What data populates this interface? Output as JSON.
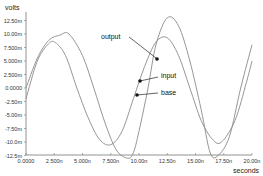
{
  "chart_data": {
    "type": "line",
    "title": "",
    "xlabel": "seconds",
    "ylabel": "volts",
    "xlim": [
      0,
      2e-08
    ],
    "ylim": [
      -0.0135,
      0.014
    ],
    "grid": false,
    "x_ticks": [
      "0.0000",
      "2.500n",
      "5.000n",
      "7.500n",
      "10.00n",
      "12.50n",
      "15.00n",
      "17.50n",
      "20.00n"
    ],
    "y_ticks": [
      "12.50m",
      "10.00m",
      "7.500m",
      "5.000m",
      "2.500m",
      "0.0000",
      "-2.50m",
      "-5.00m",
      "-7.50m",
      "-10.0m",
      "-12.5m"
    ],
    "annotations": [
      "output",
      "input",
      "base"
    ],
    "series": [
      {
        "name": "output",
        "x_ns": [
          0,
          1,
          2,
          3,
          3.8,
          5,
          6,
          7,
          8,
          9,
          9.5,
          10,
          10.8,
          11.5,
          12.5,
          13.5,
          14.5,
          15.5,
          16.3,
          17,
          18,
          19,
          20
        ],
        "values_mV": [
          0,
          5.5,
          8.8,
          9.8,
          10,
          6,
          0,
          -6.5,
          -11.5,
          -13,
          -12,
          -8,
          0,
          8,
          13,
          11.5,
          5,
          -4,
          -12,
          -12.5,
          -9,
          0,
          8
        ]
      },
      {
        "name": "input",
        "x_ns": [
          0,
          1,
          2,
          2.6,
          3.5,
          4.5,
          5.5,
          6.5,
          7.5,
          8.5,
          9.5,
          10.5,
          11.5,
          12.5,
          13.5,
          14.5,
          15.5,
          16.5,
          17.3,
          18.5,
          19.5,
          20
        ],
        "values_mV": [
          -2,
          5,
          8.2,
          8.4,
          6,
          0,
          -5.5,
          -9.5,
          -10.5,
          -8,
          -2,
          4,
          8.5,
          9.3,
          6,
          0,
          -6,
          -9.5,
          -10,
          -6,
          1,
          5
        ]
      }
    ]
  },
  "labels": {
    "ylabel": "volts",
    "xlabel": "seconds",
    "output": "output",
    "input": "input",
    "base": "base",
    "corner": ""
  }
}
